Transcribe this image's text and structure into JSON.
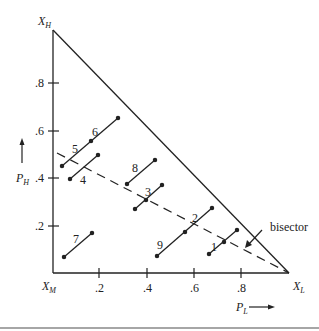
{
  "figure": {
    "vertices": {
      "top": {
        "label": "X",
        "sub": "H"
      },
      "origin": {
        "label": "X",
        "sub": "M"
      },
      "right": {
        "label": "X",
        "sub": "L"
      }
    },
    "x_axis": {
      "label": "P",
      "sub": "L",
      "ticks": [
        ".2",
        ".4",
        ".6",
        ".8"
      ]
    },
    "y_axis": {
      "label": "P",
      "sub": "H",
      "ticks": [
        ".2",
        ".4",
        ".6",
        ".8"
      ]
    },
    "bisector_label": "bisector",
    "segments": [
      {
        "id": "1",
        "label": "1"
      },
      {
        "id": "2",
        "label": "2"
      },
      {
        "id": "3",
        "label": "3"
      },
      {
        "id": "4",
        "label": "4"
      },
      {
        "id": "5",
        "label": "5"
      },
      {
        "id": "6",
        "label": "6"
      },
      {
        "id": "7",
        "label": "7"
      },
      {
        "id": "8",
        "label": "8"
      },
      {
        "id": "9",
        "label": "9"
      }
    ]
  }
}
